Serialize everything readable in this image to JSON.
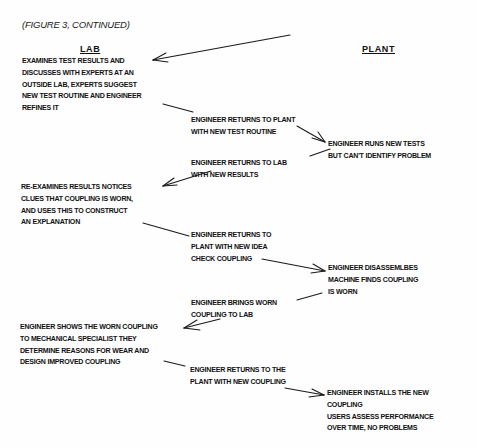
{
  "caption": "(FIGURE 3, CONTINUED)",
  "columns": {
    "lab": "LAB",
    "plant": "PLANT"
  },
  "blocks": [
    {
      "id": "lab-1",
      "column": "lab",
      "lines": [
        "EXAMINES TEST RESULTS AND",
        "DISCUSSES WITH EXPERTS AT AN",
        "OUTSIDE LAB, EXPERTS SUGGEST",
        "NEW TEST ROUTINE AND ENGINEER",
        "REFINES IT"
      ]
    },
    {
      "id": "transit-1",
      "column": "middle",
      "lines": [
        "ENGINEER RETURNS TO PLANT",
        "WITH NEW TEST ROUTINE"
      ]
    },
    {
      "id": "plant-1",
      "column": "plant",
      "lines": [
        "ENGINEER RUNS NEW TESTS",
        "BUT CAN'T IDENTIFY PROBLEM"
      ]
    },
    {
      "id": "transit-2",
      "column": "middle",
      "lines": [
        "ENGINEER RETURNS TO LAB",
        "WITH NEW RESULTS"
      ]
    },
    {
      "id": "lab-2",
      "column": "lab",
      "lines": [
        "RE-EXAMINES RESULTS  NOTICES",
        "CLUES THAT COUPLING IS WORN,",
        "AND USES THIS TO CONSTRUCT",
        "AN EXPLANATION"
      ]
    },
    {
      "id": "transit-3",
      "column": "middle",
      "lines": [
        "ENGINEER RETURNS TO",
        "PLANT WITH NEW IDEA",
        "CHECK COUPLING"
      ]
    },
    {
      "id": "plant-2",
      "column": "plant",
      "lines": [
        "ENGINEER DISASSEMLBES",
        "MACHINE  FINDS COUPLING",
        "IS WORN"
      ]
    },
    {
      "id": "transit-4",
      "column": "middle",
      "lines": [
        "ENGINEER BRINGS WORN",
        "COUPLING TO LAB"
      ]
    },
    {
      "id": "lab-3",
      "column": "lab",
      "lines": [
        "ENGINEER SHOWS THE WORN COUPLING",
        "TO MECHANICAL SPECIALIST  THEY",
        "DETERMINE REASONS FOR WEAR AND",
        "DESIGN IMPROVED COUPLING"
      ]
    },
    {
      "id": "transit-5",
      "column": "middle",
      "lines": [
        "ENGINEER RETURNS TO THE",
        "PLANT WITH NEW COUPLING"
      ]
    },
    {
      "id": "plant-3",
      "column": "plant",
      "lines": [
        "ENGINEER INSTALLS THE NEW",
        "COUPLING",
        "USERS ASSESS PERFORMANCE",
        "OVER TIME, NO PROBLEMS"
      ]
    }
  ],
  "colors": {
    "ink": "#111111",
    "paper": "#fefefe"
  }
}
